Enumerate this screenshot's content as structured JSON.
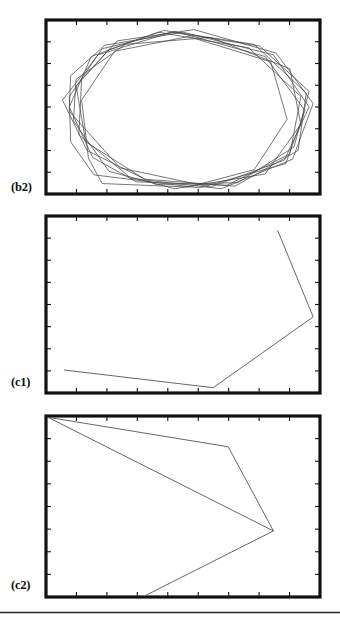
{
  "figure": {
    "width": 340,
    "height": 629,
    "background": "#ffffff",
    "frame_color": "#111111",
    "trace_color": "#4a4a4a",
    "rule_color": "#2b2b2b"
  },
  "panels": [
    {
      "id": "b2",
      "label": "(b2)",
      "label_x": 11,
      "label_y": 180,
      "frame": {
        "x": 46,
        "y": 20,
        "width": 274,
        "height": 174
      },
      "frame_stroke": 3.2,
      "ticks": {
        "top": 8,
        "bottom": 8,
        "left": 7,
        "right": 7,
        "length": 5
      }
    },
    {
      "id": "c1",
      "label": "(c1)",
      "label_x": 11,
      "label_y": 375,
      "frame": {
        "x": 46,
        "y": 216,
        "width": 274,
        "height": 177
      },
      "frame_stroke": 3.2,
      "ticks": {
        "top": 8,
        "bottom": 8,
        "left": 7,
        "right": 7,
        "length": 5
      }
    },
    {
      "id": "c2",
      "label": "(c2)",
      "label_x": 11,
      "label_y": 578,
      "frame": {
        "x": 46,
        "y": 416,
        "width": 274,
        "height": 181
      },
      "frame_stroke": 3.2,
      "ticks": {
        "top": 8,
        "bottom": 8,
        "left": 7,
        "right": 7,
        "length": 5
      }
    }
  ],
  "bottom_rule": {
    "x1": 0,
    "y1": 612.5,
    "x2": 340,
    "y2": 612.5,
    "stroke": 1.4
  },
  "chart_data": {
    "type": "line",
    "title": "",
    "xlabel": "",
    "ylabel": "",
    "grid": false,
    "legend": null,
    "panels": [
      {
        "id": "b2",
        "type": "line",
        "axis_range_x": [
          0,
          1
        ],
        "axis_range_y": [
          0,
          1
        ],
        "series": [
          {
            "name": "loop-1",
            "closed": true,
            "points": [
              [
                0.155,
                0.205
              ],
              [
                0.205,
                0.06
              ],
              [
                0.52,
                0.04
              ],
              [
                0.76,
                0.14
              ],
              [
                0.88,
                0.43
              ],
              [
                0.82,
                0.76
              ],
              [
                0.52,
                0.905
              ],
              [
                0.25,
                0.82
              ],
              [
                0.13,
                0.54
              ]
            ]
          },
          {
            "name": "loop-2",
            "closed": true,
            "points": [
              [
                0.1,
                0.42
              ],
              [
                0.23,
                0.13
              ],
              [
                0.47,
                0.03
              ],
              [
                0.8,
                0.115
              ],
              [
                0.93,
                0.4
              ],
              [
                0.89,
                0.72
              ],
              [
                0.6,
                0.9
              ],
              [
                0.29,
                0.86
              ],
              [
                0.11,
                0.66
              ]
            ]
          },
          {
            "name": "loop-3",
            "closed": true,
            "points": [
              [
                0.06,
                0.54
              ],
              [
                0.15,
                0.25
              ],
              [
                0.4,
                0.055
              ],
              [
                0.7,
                0.065
              ],
              [
                0.905,
                0.27
              ],
              [
                0.96,
                0.59
              ],
              [
                0.78,
                0.85
              ],
              [
                0.46,
                0.93
              ],
              [
                0.19,
                0.8
              ]
            ]
          },
          {
            "name": "loop-4",
            "closed": true,
            "points": [
              [
                0.175,
                0.11
              ],
              [
                0.56,
                0.035
              ],
              [
                0.875,
                0.175
              ],
              [
                0.945,
                0.48
              ],
              [
                0.8,
                0.79
              ],
              [
                0.47,
                0.935
              ],
              [
                0.205,
                0.835
              ],
              [
                0.085,
                0.56
              ],
              [
                0.09,
                0.3
              ]
            ]
          },
          {
            "name": "loop-5",
            "closed": true,
            "points": [
              [
                0.13,
                0.66
              ],
              [
                0.12,
                0.34
              ],
              [
                0.31,
                0.09
              ],
              [
                0.64,
                0.03
              ],
              [
                0.9,
                0.2
              ],
              [
                0.975,
                0.52
              ],
              [
                0.84,
                0.81
              ],
              [
                0.54,
                0.945
              ],
              [
                0.26,
                0.88
              ]
            ]
          },
          {
            "name": "loop-6",
            "closed": true,
            "points": [
              [
                0.23,
                0.83
              ],
              [
                0.11,
                0.62
              ],
              [
                0.145,
                0.3
              ],
              [
                0.36,
                0.085
              ],
              [
                0.69,
                0.045
              ],
              [
                0.92,
                0.25
              ],
              [
                0.95,
                0.58
              ],
              [
                0.76,
                0.86
              ],
              [
                0.43,
                0.94
              ]
            ]
          },
          {
            "name": "loop-7",
            "closed": true,
            "points": [
              [
                0.085,
                0.475
              ],
              [
                0.27,
                0.15
              ],
              [
                0.6,
                0.04
              ],
              [
                0.87,
                0.195
              ],
              [
                0.96,
                0.5
              ],
              [
                0.83,
                0.8
              ],
              [
                0.5,
                0.93
              ],
              [
                0.215,
                0.855
              ],
              [
                0.09,
                0.68
              ]
            ]
          },
          {
            "name": "loop-8",
            "closed": true,
            "points": [
              [
                0.33,
                0.07
              ],
              [
                0.66,
                0.05
              ],
              [
                0.89,
                0.23
              ],
              [
                0.93,
                0.56
              ],
              [
                0.74,
                0.84
              ],
              [
                0.41,
                0.93
              ],
              [
                0.165,
                0.79
              ],
              [
                0.085,
                0.5
              ],
              [
                0.17,
                0.21
              ]
            ]
          }
        ]
      },
      {
        "id": "c1",
        "type": "line",
        "axis_range_x": [
          0,
          1
        ],
        "axis_range_y": [
          0,
          1
        ],
        "series": [
          {
            "name": "trace-c1",
            "closed": false,
            "points": [
              [
                0.066,
                0.13
              ],
              [
                0.61,
                0.03
              ],
              [
                0.975,
                0.43
              ],
              [
                0.845,
                0.92
              ]
            ]
          }
        ]
      },
      {
        "id": "c2",
        "type": "line",
        "axis_range_x": [
          0,
          1
        ],
        "axis_range_y": [
          0,
          1
        ],
        "series": [
          {
            "name": "trace-c2-upper",
            "closed": false,
            "points": [
              [
                0.007,
                0.993
              ],
              [
                0.665,
                0.83
              ],
              [
                0.83,
                0.365
              ]
            ]
          },
          {
            "name": "trace-c2-lower",
            "closed": false,
            "points": [
              [
                0.007,
                0.993
              ],
              [
                0.83,
                0.365
              ],
              [
                0.365,
                0.01
              ]
            ]
          }
        ]
      }
    ]
  }
}
